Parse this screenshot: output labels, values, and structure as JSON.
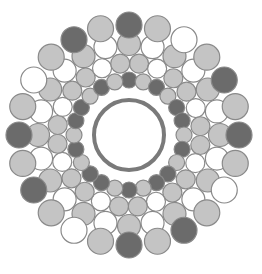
{
  "diagram": {
    "title": "",
    "type": "circle-packing cross-section",
    "center": [
      129,
      135
    ],
    "colors": {
      "background": "#ffffff",
      "dark": "#6b6b6b",
      "medium": "#c4c4c4",
      "light": "#ffffff",
      "stroke": "#8a8a8a",
      "core_ring": "#7a7a7a"
    },
    "core": {
      "outer_radius": 44,
      "ring_radius": 35,
      "ring_width": 4
    },
    "rings": [
      {
        "name": "inner-ring",
        "radius": 55,
        "circle_radius": 8,
        "count": 24,
        "start_angle": -90,
        "fills": [
          "dark",
          "medium",
          "dark",
          "medium",
          "dark",
          "dark",
          "medium",
          "dark",
          "medium",
          "dark",
          "dark",
          "medium",
          "dark",
          "medium",
          "dark",
          "dark",
          "medium",
          "dark",
          "medium",
          "dark",
          "dark",
          "medium",
          "dark",
          "medium"
        ]
      },
      {
        "name": "middle-ring",
        "radius": 72,
        "circle_radius": 9.5,
        "count": 24,
        "start_angle": -82,
        "fills": [
          "medium",
          "light",
          "medium",
          "medium",
          "light",
          "medium",
          "medium",
          "light",
          "medium",
          "medium",
          "light",
          "medium",
          "medium",
          "light",
          "medium",
          "medium",
          "light",
          "medium",
          "medium",
          "light",
          "medium",
          "medium",
          "light",
          "medium"
        ]
      },
      {
        "name": "outer-middle-ring",
        "radius": 91,
        "circle_radius": 11.5,
        "count": 24,
        "start_angle": -90,
        "fills": [
          "medium",
          "light",
          "medium",
          "light",
          "medium",
          "light",
          "medium",
          "light",
          "medium",
          "light",
          "medium",
          "light",
          "medium",
          "light",
          "medium",
          "light",
          "medium",
          "light",
          "medium",
          "light",
          "medium",
          "light",
          "medium",
          "light"
        ]
      },
      {
        "name": "outer-ring",
        "radius": 110,
        "circle_radius": 13,
        "count": 24,
        "start_angle": -90,
        "fills": [
          "dark",
          "medium",
          "light",
          "medium",
          "dark",
          "medium",
          "dark",
          "medium",
          "light",
          "medium",
          "dark",
          "medium",
          "dark",
          "medium",
          "light",
          "medium",
          "dark",
          "medium",
          "dark",
          "medium",
          "light",
          "medium",
          "dark",
          "medium"
        ]
      }
    ]
  }
}
